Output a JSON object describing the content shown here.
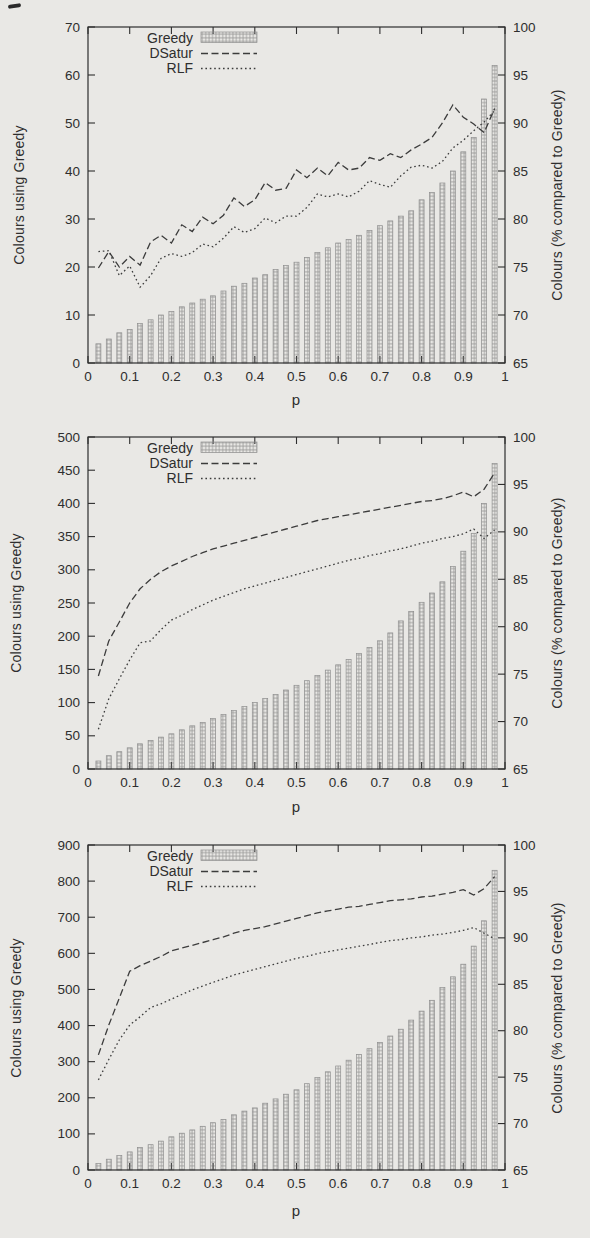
{
  "page": {
    "paper_color": "#e9e8e5",
    "ink_color": "#2e2e2e",
    "bar_outline_color": "#8f8f8f",
    "bar_hatch_color": "#6a6a6a"
  },
  "chart_data": [
    {
      "type": "bar+line combo",
      "x_label": "p",
      "y_label": "Colours using Greedy",
      "y2_label": "Colours (% compared to Greedy)",
      "xlim": [
        0,
        1
      ],
      "ylim": [
        0,
        70
      ],
      "y2lim": [
        65,
        100
      ],
      "x_ticks": [
        0,
        0.1,
        0.2,
        0.3,
        0.4,
        0.5,
        0.6,
        0.7,
        0.8,
        0.9,
        1
      ],
      "y_ticks": [
        0,
        10,
        20,
        30,
        40,
        50,
        60,
        70
      ],
      "y2_ticks": [
        65,
        70,
        75,
        80,
        85,
        90,
        95,
        100
      ],
      "grid": false,
      "legend_position": "top-left-inside",
      "legend": [
        {
          "label": "Greedy",
          "swatch": "hatched-bar"
        },
        {
          "label": "DSatur",
          "swatch": "dashed-line"
        },
        {
          "label": "RLF",
          "swatch": "dotted-line"
        }
      ],
      "x": [
        0.025,
        0.05,
        0.075,
        0.1,
        0.125,
        0.15,
        0.175,
        0.2,
        0.225,
        0.25,
        0.275,
        0.3,
        0.325,
        0.35,
        0.375,
        0.4,
        0.425,
        0.45,
        0.475,
        0.5,
        0.525,
        0.55,
        0.575,
        0.6,
        0.625,
        0.65,
        0.675,
        0.7,
        0.725,
        0.75,
        0.775,
        0.8,
        0.825,
        0.85,
        0.875,
        0.9,
        0.925,
        0.95,
        0.975
      ],
      "series": [
        {
          "name": "Greedy",
          "type": "bar",
          "axis": "left",
          "values": [
            4,
            5,
            6.3,
            7,
            8.2,
            9,
            10,
            10.7,
            11.7,
            12.5,
            13.3,
            14,
            15,
            16,
            16.6,
            17.7,
            18.4,
            19.5,
            20.3,
            21,
            22,
            23,
            24,
            25,
            25.7,
            26.6,
            27.6,
            28.6,
            29.6,
            30.6,
            31.7,
            34,
            35.5,
            37.5,
            40,
            44,
            47,
            55,
            62
          ]
        },
        {
          "name": "DSatur",
          "type": "line",
          "style": "dashed",
          "axis": "right",
          "values": [
            74.9,
            76.6,
            75,
            76.1,
            75.2,
            77.6,
            78.3,
            77.5,
            79.4,
            78.7,
            80.2,
            79.5,
            80.4,
            82.2,
            81.3,
            82,
            83.8,
            83,
            83.2,
            85.1,
            84.3,
            85.3,
            84.5,
            85.9,
            85.1,
            85.3,
            86.4,
            86.1,
            86.8,
            86.4,
            87.2,
            87.8,
            88.5,
            90,
            91.9,
            90.6,
            89.9,
            89,
            91.5
          ]
        },
        {
          "name": "RLF",
          "type": "line",
          "style": "dotted",
          "axis": "right",
          "values": [
            76.6,
            76.7,
            74.1,
            75.1,
            72.9,
            74.1,
            75.9,
            76.4,
            76.1,
            76.5,
            77.4,
            77.1,
            78,
            79.2,
            78.6,
            79,
            80.1,
            79.6,
            80.3,
            80.3,
            81.2,
            82.6,
            82.3,
            82.6,
            82.3,
            82.9,
            84,
            83.6,
            83.3,
            84.5,
            85.4,
            85.6,
            85.3,
            86,
            87.4,
            88.2,
            89.2,
            90.1,
            91.3
          ]
        }
      ]
    },
    {
      "type": "bar+line combo",
      "x_label": "p",
      "y_label": "Colours using Greedy",
      "y2_label": "Colours (% compared to Greedy)",
      "xlim": [
        0,
        1
      ],
      "ylim": [
        0,
        500
      ],
      "y2lim": [
        65,
        100
      ],
      "x_ticks": [
        0,
        0.1,
        0.2,
        0.3,
        0.4,
        0.5,
        0.6,
        0.7,
        0.8,
        0.9,
        1
      ],
      "y_ticks": [
        0,
        50,
        100,
        150,
        200,
        250,
        300,
        350,
        400,
        450,
        500
      ],
      "y2_ticks": [
        65,
        70,
        75,
        80,
        85,
        90,
        95,
        100
      ],
      "grid": false,
      "legend_position": "top-left-inside",
      "legend": [
        {
          "label": "Greedy",
          "swatch": "hatched-bar"
        },
        {
          "label": "DSatur",
          "swatch": "dashed-line"
        },
        {
          "label": "RLF",
          "swatch": "dotted-line"
        }
      ],
      "x": [
        0.025,
        0.05,
        0.075,
        0.1,
        0.125,
        0.15,
        0.175,
        0.2,
        0.225,
        0.25,
        0.275,
        0.3,
        0.325,
        0.35,
        0.375,
        0.4,
        0.425,
        0.45,
        0.475,
        0.5,
        0.525,
        0.55,
        0.575,
        0.6,
        0.625,
        0.65,
        0.675,
        0.7,
        0.725,
        0.75,
        0.775,
        0.8,
        0.825,
        0.85,
        0.875,
        0.9,
        0.925,
        0.95,
        0.975
      ],
      "series": [
        {
          "name": "Greedy",
          "type": "bar",
          "axis": "left",
          "values": [
            12,
            20,
            26,
            32,
            38,
            43,
            48,
            53,
            59,
            65,
            70,
            76,
            82,
            88,
            94,
            100,
            106,
            112,
            119,
            126,
            133,
            141,
            149,
            157,
            165,
            174,
            183,
            193,
            205,
            223,
            237,
            251,
            265,
            282,
            305,
            328,
            355,
            400,
            460
          ]
        },
        {
          "name": "DSatur",
          "type": "line",
          "style": "dashed",
          "axis": "right",
          "values": [
            74.8,
            78.5,
            80.5,
            82.5,
            84,
            85,
            85.8,
            86.4,
            86.9,
            87.4,
            87.8,
            88.2,
            88.5,
            88.8,
            89.1,
            89.4,
            89.7,
            90,
            90.3,
            90.6,
            90.9,
            91.2,
            91.4,
            91.6,
            91.8,
            92,
            92.2,
            92.4,
            92.6,
            92.8,
            93,
            93.2,
            93.3,
            93.5,
            93.8,
            94.2,
            93.7,
            94.5,
            96.2
          ]
        },
        {
          "name": "RLF",
          "type": "line",
          "style": "dotted",
          "axis": "right",
          "values": [
            69.2,
            72.4,
            74.5,
            76.5,
            78.3,
            78.5,
            79.7,
            80.7,
            81.2,
            81.8,
            82.3,
            82.8,
            83.2,
            83.6,
            84,
            84.3,
            84.6,
            84.9,
            85.2,
            85.5,
            85.8,
            86.1,
            86.4,
            86.7,
            87,
            87.2,
            87.5,
            87.7,
            88,
            88.2,
            88.5,
            88.8,
            89,
            89.3,
            89.5,
            89.8,
            90.3,
            89.3,
            90.2
          ]
        }
      ]
    },
    {
      "type": "bar+line combo",
      "x_label": "p",
      "y_label": "Colours using Greedy",
      "y2_label": "Colours (% compared to Greedy)",
      "xlim": [
        0,
        1
      ],
      "ylim": [
        0,
        900
      ],
      "y2lim": [
        65,
        100
      ],
      "x_ticks": [
        0,
        0.1,
        0.2,
        0.3,
        0.4,
        0.5,
        0.6,
        0.7,
        0.8,
        0.9,
        1
      ],
      "y_ticks": [
        0,
        100,
        200,
        300,
        400,
        500,
        600,
        700,
        800,
        900
      ],
      "y2_ticks": [
        65,
        70,
        75,
        80,
        85,
        90,
        95,
        100
      ],
      "grid": false,
      "legend_position": "top-left-inside",
      "legend": [
        {
          "label": "Greedy",
          "swatch": "hatched-bar"
        },
        {
          "label": "DSatur",
          "swatch": "dashed-line"
        },
        {
          "label": "RLF",
          "swatch": "dotted-line"
        }
      ],
      "x": [
        0.025,
        0.05,
        0.075,
        0.1,
        0.125,
        0.15,
        0.175,
        0.2,
        0.225,
        0.25,
        0.275,
        0.3,
        0.325,
        0.35,
        0.375,
        0.4,
        0.425,
        0.45,
        0.475,
        0.5,
        0.525,
        0.55,
        0.575,
        0.6,
        0.625,
        0.65,
        0.675,
        0.7,
        0.725,
        0.75,
        0.775,
        0.8,
        0.825,
        0.85,
        0.875,
        0.9,
        0.925,
        0.95,
        0.975
      ],
      "series": [
        {
          "name": "Greedy",
          "type": "bar",
          "axis": "left",
          "values": [
            18,
            30,
            40,
            50,
            62,
            70,
            80,
            92,
            102,
            111,
            121,
            131,
            140,
            153,
            163,
            172,
            185,
            197,
            210,
            222,
            239,
            256,
            272,
            288,
            304,
            320,
            336,
            353,
            371,
            390,
            415,
            440,
            470,
            505,
            535,
            570,
            620,
            690,
            830
          ]
        },
        {
          "name": "DSatur",
          "type": "line",
          "style": "dashed",
          "axis": "right",
          "values": [
            77.4,
            80.6,
            83.5,
            86.4,
            87,
            87.5,
            88,
            88.6,
            88.9,
            89.2,
            89.5,
            89.8,
            90.1,
            90.5,
            90.8,
            91,
            91.2,
            91.5,
            91.8,
            92.1,
            92.4,
            92.7,
            92.9,
            93.1,
            93.3,
            93.4,
            93.6,
            93.8,
            94,
            94.1,
            94.2,
            94.4,
            94.5,
            94.7,
            94.9,
            95.2,
            94.6,
            95.3,
            96.6
          ]
        },
        {
          "name": "RLF",
          "type": "line",
          "style": "dotted",
          "axis": "right",
          "values": [
            74.7,
            76.9,
            79,
            80.6,
            81.5,
            82.5,
            82.9,
            83.4,
            83.9,
            84.4,
            84.8,
            85.2,
            85.6,
            86,
            86.3,
            86.6,
            86.9,
            87.2,
            87.5,
            87.8,
            88,
            88.3,
            88.5,
            88.7,
            88.9,
            89.1,
            89.3,
            89.5,
            89.7,
            89.8,
            90,
            90.1,
            90.3,
            90.4,
            90.6,
            90.8,
            91.1,
            90.5,
            89.9
          ]
        }
      ]
    }
  ]
}
